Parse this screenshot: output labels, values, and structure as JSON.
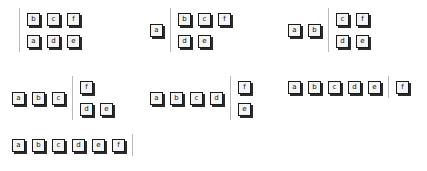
{
  "diagram": {
    "tile_letters": [
      "a",
      "b",
      "c",
      "d",
      "e",
      "f"
    ],
    "colors": {
      "tile_fill": "#f4f4f4",
      "tile_border": "#1a1a1a",
      "tile_shadow": "#2b2b2b",
      "divider": "#b9b9b9",
      "background": "#ffffff",
      "text": "#111111"
    },
    "steps": [
      {
        "id": "step-1",
        "x": 12,
        "y": 8,
        "sorted": [],
        "unsorted_row1": [
          "b",
          "c",
          "f"
        ],
        "unsorted_row2": [
          "a",
          "d",
          "e"
        ],
        "unsorted_row1_offset": 0,
        "unsorted_row2_offset": 0
      },
      {
        "id": "step-2",
        "x": 150,
        "y": 8,
        "sorted": [
          "a"
        ],
        "unsorted_row1": [
          "b",
          "c",
          "f"
        ],
        "unsorted_row2": [
          "d",
          "e"
        ],
        "unsorted_row1_offset": 0,
        "unsorted_row2_offset": 0
      },
      {
        "id": "step-3",
        "x": 288,
        "y": 8,
        "sorted": [
          "a",
          "b"
        ],
        "unsorted_row1": [
          "c",
          "f"
        ],
        "unsorted_row2": [
          "d",
          "e"
        ],
        "unsorted_row1_offset": 0,
        "unsorted_row2_offset": 0
      },
      {
        "id": "step-4",
        "x": 12,
        "y": 76,
        "sorted": [
          "a",
          "b",
          "c"
        ],
        "unsorted_row1": [
          "f"
        ],
        "unsorted_row2": [
          "d",
          "e"
        ],
        "unsorted_row1_offset": 0,
        "unsorted_row2_offset": 0
      },
      {
        "id": "step-5",
        "x": 150,
        "y": 76,
        "sorted": [
          "a",
          "b",
          "c",
          "d"
        ],
        "unsorted_row1": [
          "f"
        ],
        "unsorted_row2": [
          "e"
        ],
        "unsorted_row1_offset": 0,
        "unsorted_row2_offset": 0
      },
      {
        "id": "step-6",
        "x": 288,
        "y": 76,
        "sorted": [
          "a",
          "b",
          "c",
          "d",
          "e"
        ],
        "unsorted_row1": [
          "f"
        ],
        "unsorted_row2": [],
        "unsorted_row1_offset": 0,
        "unsorted_row2_offset": 0
      },
      {
        "id": "step-7",
        "x": 12,
        "y": 134,
        "sorted": [
          "a",
          "b",
          "c",
          "d",
          "e",
          "f"
        ],
        "unsorted_row1": [],
        "unsorted_row2": [],
        "unsorted_row1_offset": 0,
        "unsorted_row2_offset": 0
      }
    ]
  }
}
